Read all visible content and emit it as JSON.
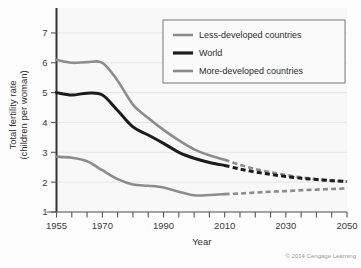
{
  "figure": {
    "background_color": "#fdfdfd",
    "plot_background_color": "#f5f5f5",
    "credit": "© 2014 Cengage Learning"
  },
  "chart_data": {
    "type": "line",
    "title": "",
    "xlabel": "Year",
    "ylabel": "Total fertility rate\n(children per woman)",
    "ylabel_line1": "Total fertility rate",
    "ylabel_line2": "(children per woman)",
    "xlim": [
      1955,
      2050
    ],
    "ylim": [
      1,
      7.5
    ],
    "yticks": [
      1,
      2,
      3,
      4,
      5,
      6,
      7
    ],
    "ytick_labels": [
      "1",
      "2",
      "3",
      "4",
      "5",
      "6",
      "7"
    ],
    "xticks": [
      1955,
      1960,
      1965,
      1970,
      1975,
      1980,
      1985,
      1990,
      1995,
      2000,
      2005,
      2010,
      2015,
      2020,
      2025,
      2030,
      2035,
      2040,
      2045,
      2050
    ],
    "xtick_labels_shown": [
      "1955",
      "1970",
      "1990",
      "2010",
      "2030",
      "2050"
    ],
    "xtick_labels_positions": [
      1955,
      1970,
      1990,
      2010,
      2030,
      2050
    ],
    "grid": true,
    "grid_axis": "y",
    "projection_start_year": 2010,
    "legend_position": "upper right",
    "series": [
      {
        "name": "Less-developed countries",
        "color": "#8c8c8c",
        "width": 2.6,
        "x": [
          1955,
          1960,
          1965,
          1970,
          1975,
          1980,
          1985,
          1990,
          1995,
          2000,
          2005,
          2010
        ],
        "values": [
          6.1,
          6.0,
          6.02,
          6.0,
          5.4,
          4.6,
          4.15,
          3.75,
          3.4,
          3.1,
          2.9,
          2.75
        ],
        "projection_x": [
          2010,
          2015,
          2020,
          2025,
          2030,
          2035,
          2040,
          2045,
          2050
        ],
        "projection_values": [
          2.75,
          2.58,
          2.44,
          2.33,
          2.24,
          2.16,
          2.1,
          2.05,
          2.02
        ]
      },
      {
        "name": "World",
        "color": "#1c1c1c",
        "width": 3.0,
        "x": [
          1955,
          1960,
          1965,
          1970,
          1975,
          1980,
          1985,
          1990,
          1995,
          2000,
          2005,
          2010
        ],
        "values": [
          5.0,
          4.92,
          4.98,
          4.92,
          4.4,
          3.85,
          3.58,
          3.3,
          3.0,
          2.8,
          2.66,
          2.56
        ],
        "projection_x": [
          2010,
          2015,
          2020,
          2025,
          2030,
          2035,
          2040,
          2045,
          2050
        ],
        "projection_values": [
          2.56,
          2.44,
          2.34,
          2.26,
          2.19,
          2.13,
          2.09,
          2.05,
          2.02
        ]
      },
      {
        "name": "More-developed countries",
        "color": "#8c8c8c",
        "width": 2.6,
        "x": [
          1955,
          1960,
          1965,
          1970,
          1975,
          1980,
          1985,
          1990,
          1995,
          2000,
          2005,
          2010
        ],
        "values": [
          2.85,
          2.82,
          2.7,
          2.4,
          2.1,
          1.92,
          1.88,
          1.82,
          1.68,
          1.56,
          1.57,
          1.6
        ],
        "projection_x": [
          2010,
          2015,
          2020,
          2025,
          2030,
          2035,
          2040,
          2045,
          2050
        ],
        "projection_values": [
          1.6,
          1.62,
          1.65,
          1.68,
          1.7,
          1.73,
          1.75,
          1.77,
          1.79
        ]
      }
    ]
  },
  "legend": {
    "items": [
      {
        "label": "Less-developed countries",
        "color": "#8c8c8c",
        "width": 2.6
      },
      {
        "label": "World",
        "color": "#1c1c1c",
        "width": 3.2
      },
      {
        "label": "More-developed countries",
        "color": "#8c8c8c",
        "width": 2.6
      }
    ]
  }
}
